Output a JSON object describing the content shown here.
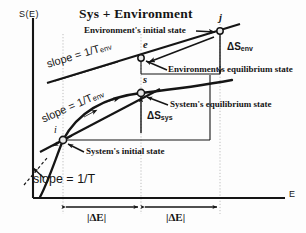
{
  "figure": {
    "title": "Sys + Environment",
    "axes": {
      "y_label": "S(E)",
      "x_label": "E"
    },
    "points": [
      {
        "id": "i",
        "label": "i",
        "x": 63,
        "y": 140,
        "caption": "System's initial state"
      },
      {
        "id": "s",
        "label": "s",
        "x": 141,
        "y": 93,
        "caption": "System's equilibrium state"
      },
      {
        "id": "e",
        "label": "e",
        "x": 141,
        "y": 58,
        "caption": "Environment's equilibrium state"
      },
      {
        "id": "j",
        "label": "j",
        "x": 220,
        "y": 31,
        "caption": "Environment's initial state"
      }
    ],
    "annotations": {
      "env_initial_state": "Environment's initial state",
      "env_equilibrium_state": "Environment's equilibrium state",
      "sys_equilibrium_state": "System's equilibrium state",
      "sys_initial_state": "System's initial state"
    },
    "slope_labels": {
      "upper_line": {
        "text": "slope =  1/T",
        "sub": "env"
      },
      "tangent_line": {
        "text": "slope =  1/T",
        "sub": "env"
      },
      "curve_at_i": {
        "text": "slope =  1/T",
        "sub": ""
      }
    },
    "entropy_changes": {
      "env": {
        "symbol": "ΔS",
        "sub": "env"
      },
      "sys": {
        "symbol": "ΔS",
        "sub": "sys"
      }
    },
    "energy_intervals": [
      {
        "label": "|ΔE|"
      },
      {
        "label": "|ΔE|"
      }
    ],
    "colors": {
      "ink": "#151515",
      "gridline": "#b9b9b9",
      "background": "#fdfdfd"
    }
  }
}
